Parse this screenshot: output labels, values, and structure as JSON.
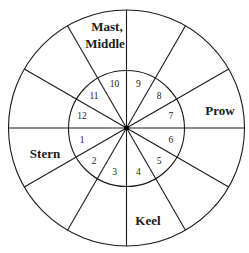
{
  "diagram": {
    "type": "circular-wheel",
    "center": [
      126.5,
      128
    ],
    "outer_radius": 118,
    "inner_radius": 58,
    "spoke_count": 12,
    "colors": {
      "stroke": "#1a1a1a",
      "background": "#ffffff"
    },
    "numbers": [
      {
        "label": "1",
        "angle": 195
      },
      {
        "label": "2",
        "angle": 225
      },
      {
        "label": "3",
        "angle": 255
      },
      {
        "label": "4",
        "angle": 285
      },
      {
        "label": "5",
        "angle": 315
      },
      {
        "label": "6",
        "angle": 345
      },
      {
        "label": "7",
        "angle": 15
      },
      {
        "label": "8",
        "angle": 45
      },
      {
        "label": "9",
        "angle": 75
      },
      {
        "label": "10",
        "angle": 105
      },
      {
        "label": "11",
        "angle": 135
      },
      {
        "label": "12",
        "angle": 165
      }
    ],
    "regions": {
      "mast_line1": "Mast,",
      "mast_line2": "Middle",
      "prow": "Prow",
      "stern": "Stern",
      "keel": "Keel"
    }
  }
}
